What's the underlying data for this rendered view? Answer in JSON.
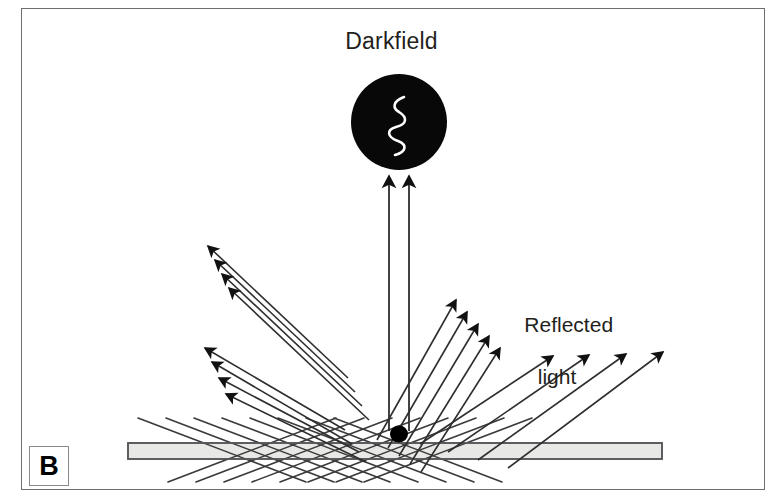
{
  "figure": {
    "panel_label": "B",
    "title": "Darkfield",
    "reflected_light_line1": "Reflected",
    "reflected_light_line2": "light",
    "colors": {
      "ink": "#231f20",
      "ray_stroke": "#3a3a3a",
      "objective_fill": "#080808",
      "specimen_fill": "#000000",
      "slide_fill": "#e8e8e6",
      "slide_stroke": "#58585a",
      "frame_stroke": "#6e6e6e",
      "background": "#ffffff",
      "squiggle_stroke": "#ffffff"
    }
  },
  "diagram": {
    "objective": {
      "name": "darkfield-objective",
      "cx": 399,
      "cy": 122,
      "r": 48
    },
    "specimen": {
      "name": "specimen-dot",
      "cx": 399,
      "cy": 434,
      "rx": 9,
      "ry": 8.5
    },
    "slide": {
      "name": "microscope-slide",
      "x": 128,
      "y": 443,
      "width": 534,
      "height": 16
    },
    "collected_rays": [
      {
        "x1": 389,
        "y1": 431,
        "x2": 389,
        "y2": 176
      },
      {
        "x1": 409,
        "y1": 431,
        "x2": 409,
        "y2": 176
      }
    ],
    "reflected_left_group_upper": [
      {
        "x1": 348,
        "y1": 378,
        "x2": 208,
        "y2": 246
      },
      {
        "x1": 355,
        "y1": 392,
        "x2": 215,
        "y2": 260
      },
      {
        "x1": 362,
        "y1": 406,
        "x2": 222,
        "y2": 274
      },
      {
        "x1": 369,
        "y1": 420,
        "x2": 229,
        "y2": 288
      }
    ],
    "reflected_left_group_lower": [
      {
        "x1": 345,
        "y1": 430,
        "x2": 205,
        "y2": 348
      },
      {
        "x1": 352,
        "y1": 444,
        "x2": 212,
        "y2": 362
      },
      {
        "x1": 359,
        "y1": 452,
        "x2": 219,
        "y2": 378
      },
      {
        "x1": 366,
        "y1": 462,
        "x2": 226,
        "y2": 394
      }
    ],
    "reflected_right_group_steep": [
      {
        "x1": 377,
        "y1": 440,
        "x2": 456,
        "y2": 300
      },
      {
        "x1": 388,
        "y1": 448,
        "x2": 467,
        "y2": 312
      },
      {
        "x1": 399,
        "y1": 456,
        "x2": 478,
        "y2": 324
      },
      {
        "x1": 410,
        "y1": 464,
        "x2": 489,
        "y2": 336
      },
      {
        "x1": 421,
        "y1": 472,
        "x2": 500,
        "y2": 348
      }
    ],
    "reflected_right_group_shallow": [
      {
        "x1": 420,
        "y1": 444,
        "x2": 553,
        "y2": 356
      },
      {
        "x1": 448,
        "y1": 452,
        "x2": 589,
        "y2": 355
      },
      {
        "x1": 478,
        "y1": 460,
        "x2": 626,
        "y2": 354
      },
      {
        "x1": 508,
        "y1": 468,
        "x2": 663,
        "y2": 352
      }
    ],
    "incident_rays_from_left": [
      {
        "x1": 168,
        "y1": 482,
        "x2": 336,
        "y2": 418
      },
      {
        "x1": 196,
        "y1": 482,
        "x2": 364,
        "y2": 418
      },
      {
        "x1": 224,
        "y1": 482,
        "x2": 392,
        "y2": 418
      },
      {
        "x1": 252,
        "y1": 482,
        "x2": 420,
        "y2": 418
      },
      {
        "x1": 280,
        "y1": 482,
        "x2": 448,
        "y2": 418
      },
      {
        "x1": 308,
        "y1": 482,
        "x2": 476,
        "y2": 418
      },
      {
        "x1": 336,
        "y1": 482,
        "x2": 504,
        "y2": 418
      },
      {
        "x1": 364,
        "y1": 482,
        "x2": 532,
        "y2": 418
      }
    ],
    "incident_rays_from_right": [
      {
        "x1": 138,
        "y1": 418,
        "x2": 306,
        "y2": 482
      },
      {
        "x1": 166,
        "y1": 418,
        "x2": 334,
        "y2": 482
      },
      {
        "x1": 194,
        "y1": 418,
        "x2": 362,
        "y2": 482
      },
      {
        "x1": 222,
        "y1": 418,
        "x2": 390,
        "y2": 482
      },
      {
        "x1": 250,
        "y1": 418,
        "x2": 418,
        "y2": 482
      },
      {
        "x1": 278,
        "y1": 418,
        "x2": 446,
        "y2": 482
      },
      {
        "x1": 306,
        "y1": 418,
        "x2": 474,
        "y2": 482
      },
      {
        "x1": 334,
        "y1": 418,
        "x2": 502,
        "y2": 482
      }
    ]
  }
}
